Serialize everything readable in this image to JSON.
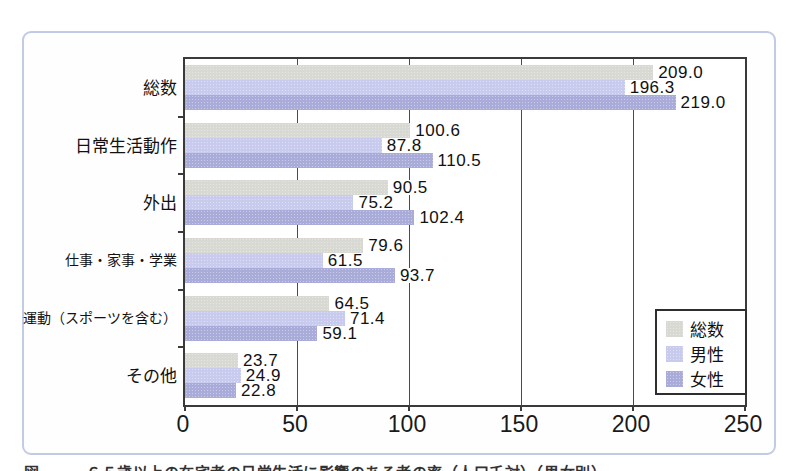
{
  "frame": {
    "border_color": "#c2cbe4",
    "background": "#ffffff"
  },
  "chart_data": {
    "type": "bar",
    "orientation": "horizontal",
    "title": "",
    "xlabel": "",
    "ylabel": "",
    "xlim": [
      0,
      250
    ],
    "x_ticks": [
      0,
      50,
      100,
      150,
      200,
      250
    ],
    "grid": "vertical gridlines every 50 units",
    "legend_position": "bottom-right inside plot",
    "categories": [
      "総数",
      "日常生活動作",
      "外出",
      "仕事・家事・学業",
      "運動（スポーツを含む）",
      "その他"
    ],
    "series": [
      {
        "name": "総数",
        "color": "#d7d9d2",
        "values": [
          209.0,
          100.6,
          90.5,
          79.6,
          64.5,
          23.7
        ],
        "labels": [
          "209.0",
          "100.6",
          "90.5",
          "79.6",
          "64.5",
          "23.7"
        ]
      },
      {
        "name": "男性",
        "color": "#c8cbee",
        "values": [
          196.3,
          87.8,
          75.2,
          61.5,
          71.4,
          24.9
        ],
        "labels": [
          "196.3",
          "87.8",
          "75.2",
          "61.5",
          "71.4",
          "24.9"
        ]
      },
      {
        "name": "女性",
        "color": "#a9acd8",
        "values": [
          219.0,
          110.5,
          102.4,
          93.7,
          59.1,
          22.8
        ],
        "labels": [
          "219.0",
          "110.5",
          "102.4",
          "93.7",
          "59.1",
          "22.8"
        ]
      }
    ]
  },
  "caption_clipped": "図　　　６５歳以上の在宅者の日常生活に影響のある者の率（人口千対）（男女別）"
}
